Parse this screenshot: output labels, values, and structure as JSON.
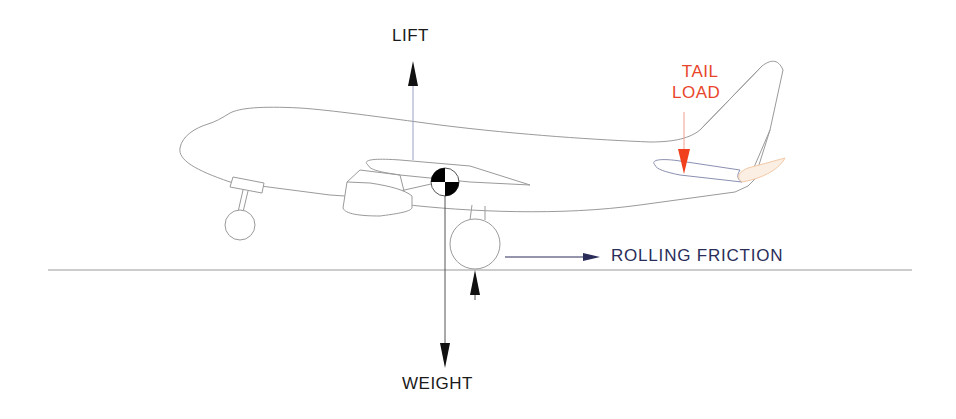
{
  "diagram": {
    "labels": {
      "lift": "LIFT",
      "weight": "WEIGHT",
      "tail_load_line1": "TAIL",
      "tail_load_line2": "LOAD",
      "rolling_friction": "ROLLING FRICTION"
    },
    "colors": {
      "outline": "#9a9a9a",
      "force_arrow": "#111111",
      "tail_load": "#f0401e",
      "rolling_friction": "#2a2d5a",
      "elevator": "#f2c9a6",
      "ground": "#9a9a9a"
    },
    "elements": [
      "fuselage",
      "wing",
      "engine",
      "nose-gear",
      "main-gear",
      "vertical-stabilizer",
      "horizontal-stabilizer",
      "elevator",
      "center-of-gravity-symbol",
      "ground-line"
    ]
  }
}
